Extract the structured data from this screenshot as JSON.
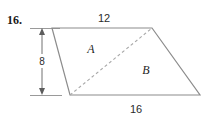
{
  "problem": {
    "number": "16."
  },
  "figure": {
    "type": "quadrilateral-with-diagonal",
    "labels": {
      "top_side": "12",
      "bottom_side": "16",
      "height": "8",
      "region_upper": "A",
      "region_lower": "B"
    },
    "colors": {
      "outline": "#8c8c8c",
      "diagonal": "#a8a8a8",
      "dimension": "#707070",
      "text": "#1f1f1f",
      "background": "#ffffff"
    },
    "vertices": {
      "top_left": [
        52,
        28
      ],
      "top_right": [
        152,
        28
      ],
      "bottom_right": [
        200,
        95
      ],
      "bottom_left": [
        70,
        95
      ]
    },
    "diagonal": {
      "from": "bottom_left",
      "to": "top_right",
      "style": "dashed"
    },
    "dimension_line": {
      "orientation": "vertical",
      "x": 42,
      "from_y": 28,
      "to_y": 95,
      "arrows": "both"
    }
  }
}
